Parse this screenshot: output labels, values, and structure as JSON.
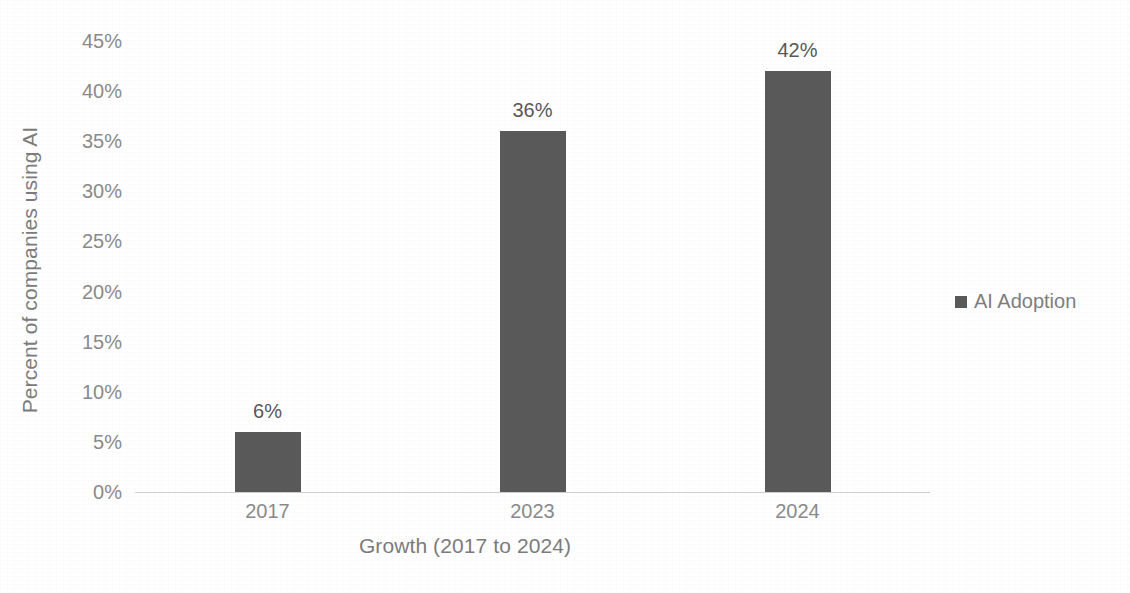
{
  "chart_data": {
    "type": "bar",
    "title": "",
    "subtitle": "",
    "xlabel": "Growth (2017 to 2024)",
    "ylabel": "Percent of companies using AI",
    "categories": [
      "2017",
      "2023",
      "2024"
    ],
    "values": [
      6,
      36,
      42
    ],
    "value_labels": [
      "6%",
      "36%",
      "42%"
    ],
    "series": [
      {
        "name": "AI Adoption",
        "values": [
          6,
          36,
          42
        ],
        "color": "#595959"
      }
    ],
    "ylim": [
      0,
      45
    ],
    "y_tick_values": [
      45,
      40,
      35,
      30,
      25,
      20,
      15,
      10,
      5,
      0
    ],
    "y_tick_labels": [
      "45%",
      "40%",
      "35%",
      "30%",
      "25%",
      "20%",
      "15%",
      "10%",
      "5%",
      "0%"
    ],
    "grid": false,
    "legend_position": "right",
    "legend_entries": [
      "AI Adoption"
    ],
    "annotations": []
  },
  "axes": {
    "y_title": "Percent of companies using AI",
    "x_title": "Growth (2017 to 2024)"
  },
  "legend": {
    "label": "AI Adoption",
    "swatch_color": "#595959"
  },
  "colors": {
    "bar": "#595959",
    "axis_text": "#8a8a8a",
    "title_text": "#7b7b7b",
    "data_label": "#585858",
    "baseline": "#a8a8ac",
    "background": "#ffffff"
  }
}
